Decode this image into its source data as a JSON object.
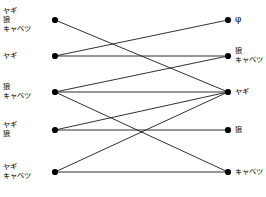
{
  "figure": {
    "title": "",
    "background_color": "#ffffff",
    "node_color": "#000000",
    "edge_color": "#1a1a1a",
    "node_radius": 3.1,
    "edge_width": 0.9,
    "width": 266,
    "height": 197
  },
  "chart_data": {
    "type": "diagram",
    "subtype": "bipartite-state-transition-graph",
    "title": "",
    "xlabel": "",
    "ylabel": "",
    "grid": false,
    "legend": null,
    "left_column_x": 55,
    "right_column_x": 228,
    "nodes": {
      "left": [
        {
          "id": "L1",
          "x": 55,
          "y": 20,
          "lines": [
            "ヤギ",
            "狼",
            "キャベツ"
          ],
          "text": "ヤギ 狼 キャベツ"
        },
        {
          "id": "L2",
          "x": 55,
          "y": 56,
          "lines": [
            "ヤギ"
          ],
          "text": "ヤギ"
        },
        {
          "id": "L3",
          "x": 55,
          "y": 92,
          "lines": [
            "狼",
            "キャベツ"
          ],
          "text": "狼 キャベツ"
        },
        {
          "id": "L4",
          "x": 55,
          "y": 130,
          "lines": [
            "ヤギ",
            "狼"
          ],
          "text": "ヤギ 狼"
        },
        {
          "id": "L5",
          "x": 55,
          "y": 172,
          "lines": [
            "ヤギ",
            "キャベツ"
          ],
          "text": "ヤギ キャベツ"
        }
      ],
      "right": [
        {
          "id": "R1",
          "x": 228,
          "y": 20,
          "lines": [
            "φ"
          ],
          "text": "φ"
        },
        {
          "id": "R2",
          "x": 228,
          "y": 56,
          "lines": [
            "狼",
            "キャベツ"
          ],
          "text": "狼 キャベツ"
        },
        {
          "id": "R3",
          "x": 228,
          "y": 92,
          "lines": [
            "ヤギ"
          ],
          "text": "ヤギ"
        },
        {
          "id": "R4",
          "x": 228,
          "y": 130,
          "lines": [
            "狼"
          ],
          "text": "狼"
        },
        {
          "id": "R5",
          "x": 228,
          "y": 172,
          "lines": [
            "キャベツ"
          ],
          "text": "キャベツ"
        }
      ]
    },
    "edges": [
      {
        "from": "L1",
        "to": "R3"
      },
      {
        "from": "L2",
        "to": "R1"
      },
      {
        "from": "L2",
        "to": "R2"
      },
      {
        "from": "L3",
        "to": "R2"
      },
      {
        "from": "L3",
        "to": "R3"
      },
      {
        "from": "L3",
        "to": "R5"
      },
      {
        "from": "L4",
        "to": "R3"
      },
      {
        "from": "L4",
        "to": "R4"
      },
      {
        "from": "L5",
        "to": "R3"
      },
      {
        "from": "L5",
        "to": "R5"
      }
    ]
  }
}
